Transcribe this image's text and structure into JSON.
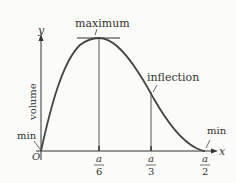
{
  "diagram": {
    "axes": {
      "x_label": "x",
      "y_label": "y",
      "vertical_label": "volume",
      "origin_label": "O"
    },
    "annotations": {
      "maximum": "maximum",
      "inflection": "inflection",
      "min_left": "min",
      "min_right": "min"
    },
    "ticks": [
      {
        "num": "a",
        "den": "6"
      },
      {
        "num": "a",
        "den": "3"
      },
      {
        "num": "a",
        "den": "2"
      }
    ],
    "colors": {
      "curve": "#444444",
      "axes": "#333333",
      "background": "#fbfbf9"
    }
  }
}
